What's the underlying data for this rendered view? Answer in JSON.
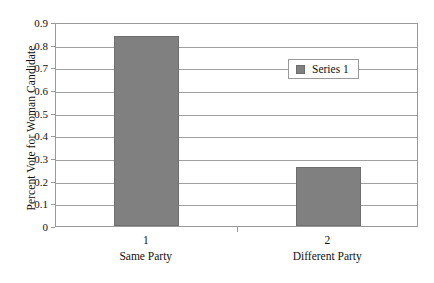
{
  "chart_data": {
    "type": "bar",
    "title": "",
    "xlabel": "",
    "ylabel": "Percent Vote for Woman Candidate",
    "categories": [
      "1",
      "2"
    ],
    "category_names": [
      "Same Party",
      "Different Party"
    ],
    "values": [
      0.84,
      0.26
    ],
    "series": [
      {
        "name": "Series 1",
        "values": [
          0.84,
          0.26
        ]
      }
    ],
    "ylim": [
      0,
      0.9
    ],
    "ytick_labels": [
      "0",
      "0.1",
      "0.2",
      "0.3",
      "0.4",
      "0.5",
      "0.6",
      "0.7",
      "0.8",
      "0.9"
    ],
    "ytick_values": [
      0,
      0.1,
      0.2,
      0.3,
      0.4,
      0.5,
      0.6,
      0.7,
      0.8,
      0.9
    ],
    "grid": true,
    "legend_position": "upper-right-inside",
    "bar_color": "#808080",
    "bar_edge_color": "#6e6e6e",
    "grid_color": "#a0a0a0",
    "axis_color": "#9a9a9a",
    "background": "#ffffff"
  },
  "legend": {
    "entries": [
      {
        "label": "Series 1",
        "color": "#808080"
      }
    ]
  },
  "axis": {
    "y_title": "Percent Vote for Woman Candidate"
  }
}
